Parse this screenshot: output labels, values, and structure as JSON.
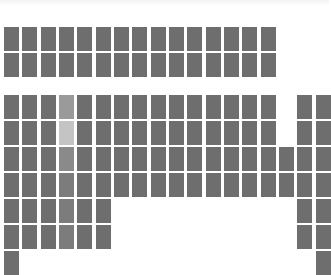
{
  "colors": {
    "background": "#ffffff",
    "tile": "#6e6e6e",
    "tile_highlight_top": "#9a9a9a",
    "tile_highlight_light": "#c4c4c4",
    "tile_highlight_mid": "#8a8a8a",
    "tile_highlight_soft": "#7c7c7c"
  },
  "layout": {
    "col_start_x": 4,
    "col_pitch": 18.33,
    "tile_width": 15,
    "tile_height": 24
  },
  "top_grid": {
    "rows_y": [
      27,
      53
    ],
    "rows": [
      [
        0,
        1,
        2,
        3,
        4,
        5,
        6,
        7,
        8,
        9,
        10,
        11,
        12,
        13,
        14
      ],
      [
        0,
        1,
        2,
        3,
        4,
        5,
        6,
        7,
        8,
        9,
        10,
        11,
        12,
        13,
        14
      ]
    ]
  },
  "lower_grid": {
    "rows_y": [
      95,
      121,
      147,
      173,
      199,
      225,
      251
    ],
    "rows": [
      [
        0,
        1,
        2,
        3,
        4,
        5,
        6,
        7,
        8,
        9,
        10,
        11,
        12,
        13,
        14,
        16,
        17
      ],
      [
        0,
        1,
        2,
        3,
        4,
        5,
        6,
        7,
        8,
        9,
        10,
        11,
        12,
        13,
        14,
        16,
        17
      ],
      [
        0,
        1,
        2,
        3,
        4,
        5,
        6,
        7,
        8,
        9,
        10,
        11,
        12,
        13,
        14,
        15,
        16,
        17
      ],
      [
        0,
        1,
        2,
        3,
        4,
        5,
        6,
        7,
        8,
        9,
        10,
        11,
        12,
        13,
        14,
        15,
        16,
        17
      ],
      [
        0,
        1,
        2,
        3,
        4,
        5,
        16,
        17
      ],
      [
        0,
        1,
        2,
        3,
        4,
        5,
        16,
        17
      ],
      [
        0,
        17
      ]
    ],
    "highlighted_column": 3,
    "highlight_shades": [
      "tile_highlight_top",
      "tile_highlight_light",
      "tile_highlight_mid",
      "tile_highlight_soft",
      "tile_highlight_soft",
      "tile_highlight_soft",
      null
    ]
  }
}
